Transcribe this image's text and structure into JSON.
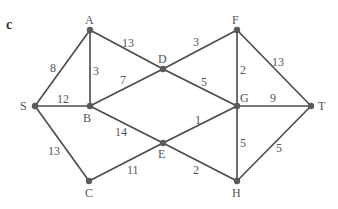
{
  "figure": {
    "part_label": "c",
    "nodes": [
      {
        "id": "S",
        "x": 35,
        "y": 106,
        "lx": 20,
        "ly": 110
      },
      {
        "id": "A",
        "x": 90,
        "y": 30,
        "lx": 85,
        "ly": 24
      },
      {
        "id": "B",
        "x": 90,
        "y": 106,
        "lx": 83,
        "ly": 122
      },
      {
        "id": "C",
        "x": 89,
        "y": 181,
        "lx": 85,
        "ly": 197
      },
      {
        "id": "D",
        "x": 163,
        "y": 69,
        "lx": 158,
        "ly": 63
      },
      {
        "id": "E",
        "x": 163,
        "y": 143,
        "lx": 158,
        "ly": 158
      },
      {
        "id": "F",
        "x": 237,
        "y": 30,
        "lx": 232,
        "ly": 24
      },
      {
        "id": "G",
        "x": 237,
        "y": 106,
        "lx": 240,
        "ly": 102
      },
      {
        "id": "H",
        "x": 237,
        "y": 181,
        "lx": 232,
        "ly": 197
      },
      {
        "id": "T",
        "x": 311,
        "y": 106,
        "lx": 318,
        "ly": 110
      }
    ],
    "edges": [
      {
        "from": "S",
        "to": "A",
        "weight": "8",
        "lx": 50,
        "ly": 72
      },
      {
        "from": "S",
        "to": "B",
        "weight": "12",
        "lx": 57,
        "ly": 103
      },
      {
        "from": "S",
        "to": "C",
        "weight": "13",
        "lx": 48,
        "ly": 155
      },
      {
        "from": "A",
        "to": "B",
        "weight": "3",
        "lx": 93,
        "ly": 75
      },
      {
        "from": "A",
        "to": "D",
        "weight": "13",
        "lx": 122,
        "ly": 47
      },
      {
        "from": "B",
        "to": "D",
        "weight": "7",
        "lx": 120,
        "ly": 84
      },
      {
        "from": "B",
        "to": "E",
        "weight": "14",
        "lx": 115,
        "ly": 136
      },
      {
        "from": "C",
        "to": "E",
        "weight": "11",
        "lx": 127,
        "ly": 174
      },
      {
        "from": "D",
        "to": "F",
        "weight": "3",
        "lx": 193,
        "ly": 46
      },
      {
        "from": "D",
        "to": "G",
        "weight": "5",
        "lx": 201,
        "ly": 86
      },
      {
        "from": "F",
        "to": "G",
        "weight": "2",
        "lx": 240,
        "ly": 74
      },
      {
        "from": "F",
        "to": "T",
        "weight": "13",
        "lx": 272,
        "ly": 66
      },
      {
        "from": "G",
        "to": "T",
        "weight": "9",
        "lx": 270,
        "ly": 102
      },
      {
        "from": "E",
        "to": "G",
        "weight": "1",
        "lx": 195,
        "ly": 124
      },
      {
        "from": "G",
        "to": "H",
        "weight": "5",
        "lx": 240,
        "ly": 147
      },
      {
        "from": "E",
        "to": "H",
        "weight": "2",
        "lx": 193,
        "ly": 174
      },
      {
        "from": "T",
        "to": "H",
        "weight": "5",
        "lx": 276,
        "ly": 152
      }
    ]
  }
}
